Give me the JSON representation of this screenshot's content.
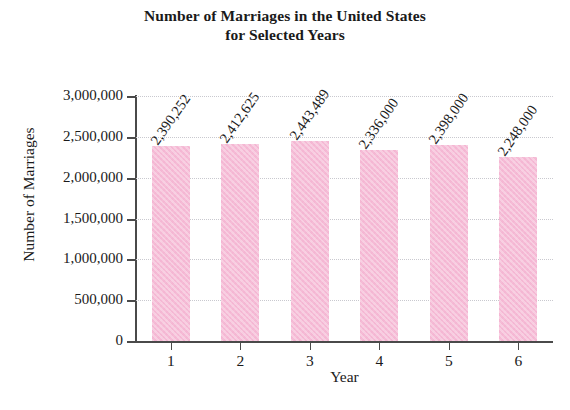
{
  "chart_data": {
    "type": "bar",
    "title": "Number of Marriages in the United States for Selected Years",
    "title_lines": [
      "Number of Marriages in the United States",
      "for Selected Years"
    ],
    "xlabel": "Year",
    "ylabel": "Number of Marriages",
    "categories": [
      "1",
      "2",
      "3",
      "4",
      "5",
      "6"
    ],
    "values": [
      2390252,
      2412625,
      2443489,
      2336000,
      2398000,
      2248000
    ],
    "value_labels": [
      "2,390,252",
      "2,412,625",
      "2,443,489",
      "2,336,000",
      "2,398,000",
      "2,248,000"
    ],
    "ylim": [
      0,
      3000000
    ],
    "ytick_values": [
      0,
      500000,
      1000000,
      1500000,
      2000000,
      2500000,
      3000000
    ],
    "ytick_labels": [
      "0",
      "500,000",
      "1,000,000",
      "1,500,000",
      "2,000,000",
      "2,500,000",
      "3,000,000"
    ],
    "grid": true,
    "legend": null,
    "bar_color": "#f5bcd6",
    "axis_color": "#4a4a4a",
    "gridline_color": "#c9c9cf"
  },
  "bottom_caption": ""
}
